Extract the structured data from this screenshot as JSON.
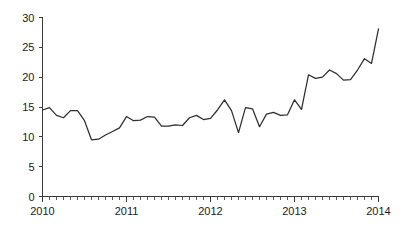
{
  "chart_data": {
    "type": "line",
    "title": "",
    "subtitle": "",
    "xlabel": "",
    "ylabel": "",
    "xlim": [
      2010.0,
      2014.0
    ],
    "ylim": [
      0,
      30
    ],
    "grid": false,
    "legend": null,
    "y_ticks": [
      0,
      5,
      10,
      15,
      20,
      25,
      30
    ],
    "y_tick_labels": [
      "0",
      "5",
      "10",
      "15",
      "20",
      "25",
      "30"
    ],
    "x_ticks": [
      2010,
      2011,
      2012,
      2013,
      2014
    ],
    "x_tick_labels": [
      "2010",
      "2011",
      "2012",
      "2013",
      "2014"
    ],
    "x_minor_ticks_per_year": 12,
    "series": [
      {
        "name": "series-1",
        "color": "#2e2e2e",
        "x": [
          2010.0,
          2010.0833,
          2010.1667,
          2010.25,
          2010.3333,
          2010.4167,
          2010.5,
          2010.5833,
          2010.6667,
          2010.75,
          2010.8333,
          2010.9167,
          2011.0,
          2011.0833,
          2011.1667,
          2011.25,
          2011.3333,
          2011.4167,
          2011.5,
          2011.5833,
          2011.6667,
          2011.75,
          2011.8333,
          2011.9167,
          2012.0,
          2012.0833,
          2012.1667,
          2012.25,
          2012.3333,
          2012.4167,
          2012.5,
          2012.5833,
          2012.6667,
          2012.75,
          2012.8333,
          2012.9167,
          2013.0,
          2013.0833,
          2013.1667,
          2013.25,
          2013.3333,
          2013.4167,
          2013.5,
          2013.5833,
          2013.6667,
          2013.75,
          2013.8333,
          2013.9167,
          2014.0
        ],
        "values": [
          14.5,
          14.9,
          13.6,
          13.2,
          14.4,
          14.4,
          12.7,
          9.5,
          9.6,
          10.3,
          10.9,
          11.5,
          13.4,
          12.7,
          12.8,
          13.4,
          13.3,
          11.8,
          11.8,
          12.0,
          11.9,
          13.2,
          13.6,
          12.9,
          13.1,
          14.5,
          16.2,
          14.4,
          10.7,
          14.9,
          14.7,
          11.7,
          13.8,
          14.1,
          13.6,
          13.7,
          16.2,
          14.6,
          20.4,
          19.8,
          20.0,
          21.2,
          20.6,
          19.5,
          19.6,
          21.2,
          23.1,
          22.3,
          28.1
        ]
      }
    ]
  }
}
